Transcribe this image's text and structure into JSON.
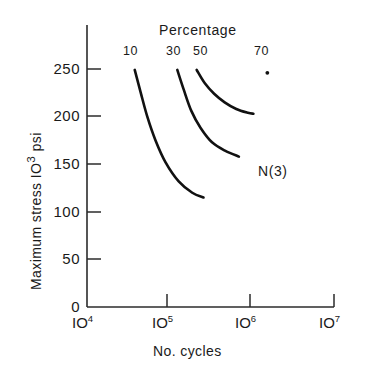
{
  "chart_data": {
    "type": "line",
    "title": "",
    "legend_title": "Percentage",
    "legend_position": "top-inside",
    "xlabel": "No. cycles",
    "ylabel": "Maximum stress  IO³ psi",
    "ylabel_parts": {
      "text": "Maximum stress  IO",
      "exponent": "3",
      "suffix": " psi"
    },
    "xscale": "log",
    "yscale": "linear",
    "xlim": [
      10000,
      10000000
    ],
    "ylim": [
      0,
      275
    ],
    "grid": false,
    "x_tick_labels": [
      "10⁴",
      "10⁵",
      "10⁶",
      "10⁷"
    ],
    "x_tick_bases": [
      "IO",
      "IO",
      "IO",
      "IO"
    ],
    "x_tick_exponents": [
      "4",
      "5",
      "6",
      "7"
    ],
    "x_tick_values": [
      10000,
      100000,
      1000000,
      10000000
    ],
    "y_tick_labels": [
      "0",
      "50",
      "100",
      "150",
      "200",
      "250"
    ],
    "y_tick_values": [
      0,
      50,
      100,
      150,
      200,
      250
    ],
    "annotations": [
      {
        "text": "N(3)",
        "x": 1700000,
        "y": 148
      }
    ],
    "series": [
      {
        "name": "10",
        "label": "10",
        "label_x": 40000,
        "label_y": 268,
        "points": [
          {
            "x": 38000,
            "y": 249
          },
          {
            "x": 45000,
            "y": 225
          },
          {
            "x": 54000,
            "y": 200
          },
          {
            "x": 68000,
            "y": 175
          },
          {
            "x": 90000,
            "y": 152
          },
          {
            "x": 130000,
            "y": 132
          },
          {
            "x": 190000,
            "y": 120
          },
          {
            "x": 260000,
            "y": 115
          }
        ]
      },
      {
        "name": "30",
        "label": "30",
        "label_x": 125000,
        "label_y": 268,
        "points": [
          {
            "x": 125000,
            "y": 249
          },
          {
            "x": 150000,
            "y": 228
          },
          {
            "x": 185000,
            "y": 206
          },
          {
            "x": 240000,
            "y": 188
          },
          {
            "x": 330000,
            "y": 173
          },
          {
            "x": 480000,
            "y": 164
          },
          {
            "x": 700000,
            "y": 158
          }
        ]
      },
      {
        "name": "50",
        "label": "50",
        "label_x": 215000,
        "label_y": 268,
        "points": [
          {
            "x": 215000,
            "y": 249
          },
          {
            "x": 270000,
            "y": 235
          },
          {
            "x": 350000,
            "y": 224
          },
          {
            "x": 470000,
            "y": 215
          },
          {
            "x": 650000,
            "y": 208
          },
          {
            "x": 900000,
            "y": 204
          },
          {
            "x": 1050000,
            "y": 203
          }
        ]
      },
      {
        "name": "70",
        "label": "70",
        "label_x": 1550000,
        "label_y": 268,
        "points": [
          {
            "x": 1550000,
            "y": 246
          }
        ],
        "marker_only": true
      }
    ]
  },
  "labels": {
    "legend_title": "Percentage",
    "series_10": "10",
    "series_30": "30",
    "series_50": "50",
    "series_70": "70",
    "annotation_n3": "N(3)",
    "x_axis_title": "No. cycles",
    "y_axis_title_main": "Maximum stress  IO",
    "y_axis_title_exp": "3",
    "y_axis_title_suffix": " psi",
    "y_0": "0",
    "y_50": "50",
    "y_100": "100",
    "y_150": "150",
    "y_200": "200",
    "y_250": "250",
    "x_base": "IO",
    "x_exp_4": "4",
    "x_exp_5": "5",
    "x_exp_6": "6",
    "x_exp_7": "7"
  },
  "style": {
    "line_color": "#111111",
    "axis_color": "#2b2b2b",
    "text_color": "#1a1a1a",
    "background": "#ffffff"
  }
}
